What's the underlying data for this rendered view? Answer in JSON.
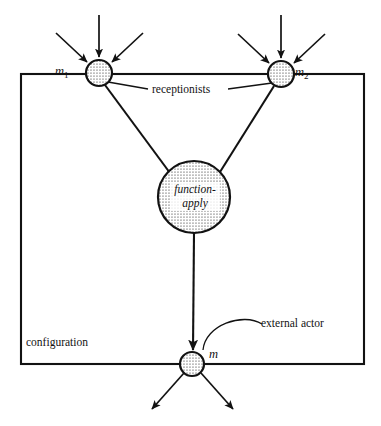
{
  "diagram": {
    "stroke_color": "#121212",
    "fill_color": "#ffffff",
    "dot_color": "#1a1a1a",
    "labels": {
      "m1": "m",
      "m1_sub": "1",
      "m2": "m",
      "m2_sub": "2",
      "m": "m",
      "receptionists": "receptionists",
      "configuration": "configuration",
      "external_actor": "external actor",
      "function_apply_line1": "function-",
      "function_apply_line2": "apply"
    },
    "nodes": [
      {
        "id": "m1",
        "label": "m1",
        "cx": 99,
        "cy": 73,
        "r": 13,
        "fill": "stippled"
      },
      {
        "id": "m2",
        "label": "m2",
        "cx": 281,
        "cy": 74,
        "r": 13,
        "fill": "stippled"
      },
      {
        "id": "function-apply",
        "label": "function-apply",
        "cx": 194,
        "cy": 197,
        "r": 36,
        "fill": "stippled"
      },
      {
        "id": "m",
        "label": "m",
        "cx": 192,
        "cy": 364,
        "r": 12,
        "fill": "stippled"
      }
    ],
    "boundary": {
      "x": 21,
      "y": 74,
      "width": 343,
      "height": 290
    },
    "edges": [
      {
        "from": "m1",
        "to": "function-apply"
      },
      {
        "from": "m2",
        "to": "function-apply"
      },
      {
        "from": "function-apply",
        "to": "m",
        "arrow": true
      }
    ],
    "incoming_arrows": [
      {
        "target": "m1",
        "from_x": 56,
        "from_y": 33
      },
      {
        "target": "m1",
        "from_x": 99,
        "from_y": 16
      },
      {
        "target": "m1",
        "from_x": 142,
        "from_y": 33
      },
      {
        "target": "m2",
        "from_x": 238,
        "from_y": 34
      },
      {
        "target": "m2",
        "from_x": 281,
        "from_y": 16
      },
      {
        "target": "m2",
        "from_x": 324,
        "from_y": 34
      }
    ],
    "outgoing_arrows": [
      {
        "source": "m",
        "to_x": 152,
        "to_y": 409
      },
      {
        "source": "m",
        "to_x": 232,
        "to_y": 409
      }
    ]
  }
}
